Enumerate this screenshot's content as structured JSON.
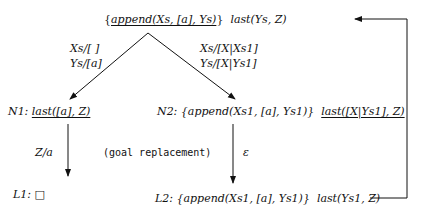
{
  "diagram": {
    "root": {
      "open_brace": "{",
      "underlined_goal": "append(Xs, [a], Ys)",
      "close_brace": "}",
      "goal": "last(Ys, Z)"
    },
    "edges": {
      "left_substitution": [
        "Xs/[ ]",
        "Ys/[a]"
      ],
      "right_substitution": [
        "Xs/[X|Xs1]",
        "Ys/[X|Ys1]"
      ],
      "n1_to_l1_label": "Z/a",
      "n2_to_l2_annotation": "(goal replacement)",
      "n2_to_l2_label": "ε"
    },
    "nodes": {
      "n1": {
        "label": "N1:",
        "underlined_goal": "last([a], Z)"
      },
      "n2": {
        "label": "N2:",
        "goal": "{append(Xs1, [a], Ys1)}",
        "underlined_goal": "last([X|Ys1], Z)"
      },
      "l1": {
        "label": "L1:",
        "symbol": "□"
      },
      "l2": {
        "label": "L2:",
        "goal": "{append(Xs1, [a], Ys1)}",
        "goal2": "last(Ys1, Z)"
      }
    }
  }
}
